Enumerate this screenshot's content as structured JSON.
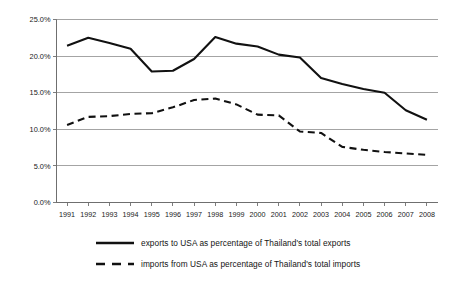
{
  "chart_data": {
    "type": "line",
    "title": "",
    "subtitle": "",
    "xlabel": "",
    "ylabel": "",
    "categories": [
      "1991",
      "1992",
      "1993",
      "1994",
      "1995",
      "1996",
      "1997",
      "1998",
      "1999",
      "2000",
      "2001",
      "2002",
      "2003",
      "2004",
      "2005",
      "2006",
      "2007",
      "2008"
    ],
    "series": [
      {
        "name": "exports to USA as percentage of Thailand's total exports",
        "style": "solid",
        "color": "#111111",
        "values": [
          21.4,
          22.5,
          21.8,
          21.0,
          17.9,
          18.0,
          19.6,
          22.6,
          21.7,
          21.3,
          20.2,
          19.8,
          17.0,
          16.2,
          15.5,
          15.0,
          12.6,
          11.3
        ]
      },
      {
        "name": "imports from USA as percentage of Thailand's total imports",
        "style": "dashed",
        "color": "#111111",
        "values": [
          10.6,
          11.7,
          11.8,
          12.1,
          12.2,
          13.0,
          14.0,
          14.2,
          13.4,
          12.0,
          11.9,
          9.7,
          9.5,
          7.6,
          7.2,
          6.9,
          6.7,
          6.5
        ]
      }
    ],
    "ylim": [
      0,
      25
    ],
    "ytick_values": [
      0,
      5,
      10,
      15,
      20,
      25
    ],
    "ytick_labels": [
      "0.0%",
      "5.0%",
      "10.0%",
      "15.0%",
      "20.0%",
      "25.0%"
    ],
    "grid": true,
    "grid_axis": "y",
    "legend_position": "bottom",
    "value_suffix": "%"
  },
  "legend": {
    "entries": [
      {
        "label": "exports to USA as percentage of Thailand's total exports",
        "style": "solid"
      },
      {
        "label": "imports from USA as percentage of Thailand's total imports",
        "style": "dashed"
      }
    ]
  }
}
